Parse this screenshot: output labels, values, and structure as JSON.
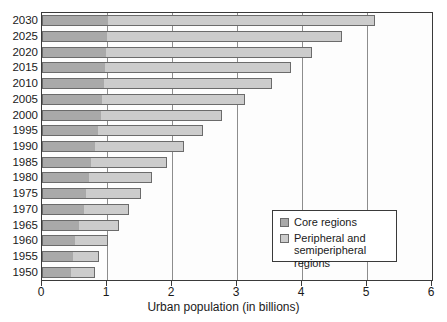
{
  "chart_data": {
    "type": "bar",
    "orientation": "horizontal",
    "stacked": true,
    "title": "",
    "xlabel": "Urban population (in billions)",
    "ylabel": "",
    "xlim": [
      0,
      6
    ],
    "xticks": [
      0,
      1,
      2,
      3,
      4,
      5,
      6
    ],
    "xtick_labels": [
      "0",
      "1",
      "2",
      "3",
      "4",
      "5",
      "6"
    ],
    "grid": "vertical",
    "legend_position": "center-right-inside",
    "categories": [
      "2030",
      "2025",
      "2020",
      "2015",
      "2010",
      "2005",
      "2000",
      "1995",
      "1990",
      "1985",
      "1980",
      "1975",
      "1970",
      "1965",
      "1960",
      "1955",
      "1950"
    ],
    "series": [
      {
        "name": "Core regions",
        "color": "#a9a9a9",
        "values": [
          1.02,
          1.0,
          0.99,
          0.97,
          0.95,
          0.93,
          0.9,
          0.86,
          0.81,
          0.76,
          0.72,
          0.68,
          0.64,
          0.57,
          0.51,
          0.47,
          0.44
        ]
      },
      {
        "name": "Peripheral and semiperipheral regions",
        "color": "#cccccc",
        "values": [
          4.11,
          3.61,
          3.16,
          2.86,
          2.59,
          2.19,
          1.87,
          1.61,
          1.38,
          1.16,
          0.98,
          0.84,
          0.7,
          0.61,
          0.51,
          0.4,
          0.37
        ]
      }
    ],
    "totals": [
      5.13,
      4.61,
      4.15,
      3.83,
      3.54,
      3.12,
      2.77,
      2.47,
      2.19,
      1.92,
      1.7,
      1.52,
      1.34,
      1.18,
      1.02,
      0.87,
      0.81
    ]
  },
  "legend": {
    "items": [
      {
        "label": "Core regions",
        "swatch_name": "core-regions-swatch"
      },
      {
        "label": "Peripheral and semiperipheral regions",
        "swatch_name": "peripheral-regions-swatch"
      }
    ]
  },
  "colors": {
    "core": "#a9a9a9",
    "peripheral": "#cccccc",
    "frame": "#3a3a3a",
    "gridline": "#8d8d8d",
    "bar_outline": "#6b6b6b",
    "text": "#1a1a1a",
    "background": "#ffffff"
  }
}
